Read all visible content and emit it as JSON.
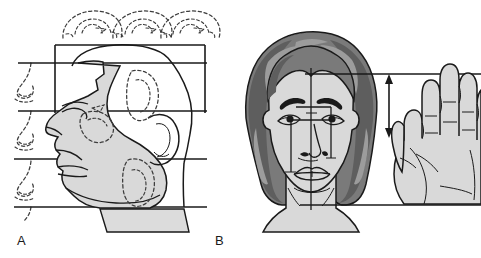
{
  "figure": {
    "type": "anatomical-illustration",
    "background_color": "#ffffff",
    "line_color": "#1a1a1a",
    "skin_fill": "#d9d9d9",
    "hair_fill": "#7a7a7a",
    "hair_shadow_fill": "#5e5e5e",
    "hair_highlight_fill": "#9c9c9c",
    "dashed_color": "#3c3c3c"
  },
  "panels": [
    {
      "id": "A",
      "label": "A",
      "view": "lateral-profile",
      "reference_lines": 5,
      "dashed_overlays": {
        "top_row_count": 3,
        "left_column_count": 4,
        "internal_count": 4
      }
    },
    {
      "id": "B",
      "label": "B",
      "view": "frontal",
      "reference_lines": 2,
      "measurement": {
        "name": "finger-length-arrow",
        "style": "double-headed-vertical-arrow"
      }
    }
  ],
  "labels": {
    "a": "A",
    "b": "B"
  }
}
